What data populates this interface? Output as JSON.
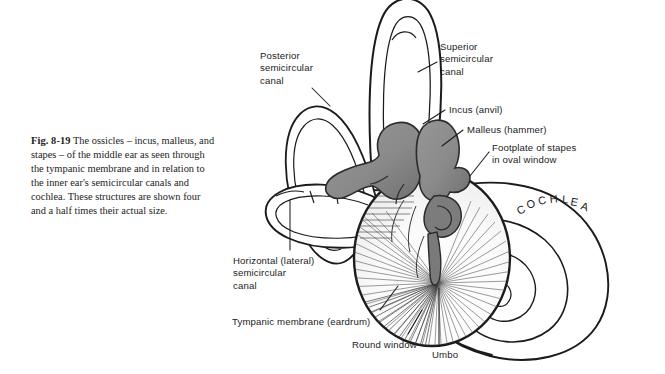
{
  "figure": {
    "number": "Fig. 8-19",
    "caption": "The ossicles – incus, malleus, and stapes – of the middle ear as seen through the tympanic membrane and in relation to the inner ear's semicircular canals and cochlea. These structures are shown four and a half times their actual size."
  },
  "labels": {
    "posterior_canal": "Posterior\nsemicircular\ncanal",
    "superior_canal": "Superior\nsemicircular\ncanal",
    "incus": "Incus (anvil)",
    "malleus": "Malleus (hammer)",
    "footplate": "Footplate of stapes\nin oval window",
    "horizontal_canal": "Horizontal (lateral)\nsemicircular\ncanal",
    "tympanic_membrane": "Tympanic membrane (eardrum)",
    "round_window": "Round window",
    "umbo": "Umbo",
    "cochlea": "COCHLEA"
  },
  "cochlea_letters": [
    "C",
    "O",
    "C",
    "H",
    "L",
    "E",
    "A"
  ],
  "colors": {
    "background": "#ffffff",
    "ink": "#1b1b1b",
    "caption_text": "#232323",
    "ossicle_fill": "#8a8a8a",
    "ossicle_shadow": "#6d6d6d",
    "membrane_fill": "#fbfbfb",
    "hatch_line": "#4a4a4a"
  }
}
